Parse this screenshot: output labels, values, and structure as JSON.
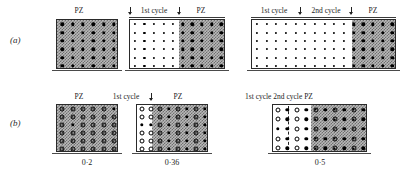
{
  "figure": {
    "rows": [
      {
        "id": "a",
        "label": "(a)"
      },
      {
        "id": "b",
        "label": "(b)"
      }
    ]
  },
  "labels": {
    "pz": "PZ",
    "first_cycle": "1st cycle",
    "second_cycle": "2nd cycle"
  },
  "row_a": {
    "panels": [
      {
        "name": "panel-a1",
        "headers": [
          {
            "text": "PZ"
          }
        ],
        "caption": ""
      },
      {
        "name": "panel-a2",
        "headers": [
          {
            "text": "1st cycle"
          },
          {
            "text": "PZ"
          }
        ],
        "caption": ""
      },
      {
        "name": "panel-a3",
        "headers": [
          {
            "text": "1st cycle"
          },
          {
            "text": "2nd cycle"
          },
          {
            "text": "PZ"
          }
        ],
        "caption": ""
      }
    ]
  },
  "row_b": {
    "panels": [
      {
        "name": "panel-b1",
        "headers": [
          {
            "text": "PZ"
          }
        ],
        "caption": "0·2"
      },
      {
        "name": "panel-b2",
        "headers": [
          {
            "text": "1st cycle"
          },
          {
            "text": "PZ"
          }
        ],
        "caption": "0·36"
      },
      {
        "name": "panel-b3",
        "headers": [
          {
            "text": "1st cycle 2nd cycle PZ"
          }
        ],
        "caption": "0·5"
      }
    ]
  },
  "colors": {
    "pz_fill": "#b9b9b9",
    "pz_hatch": "#6f6f6f",
    "marker": "#000000",
    "border": "#2a2a2a",
    "baseline": "#4a4a4a",
    "text": "#1c1c1c"
  }
}
